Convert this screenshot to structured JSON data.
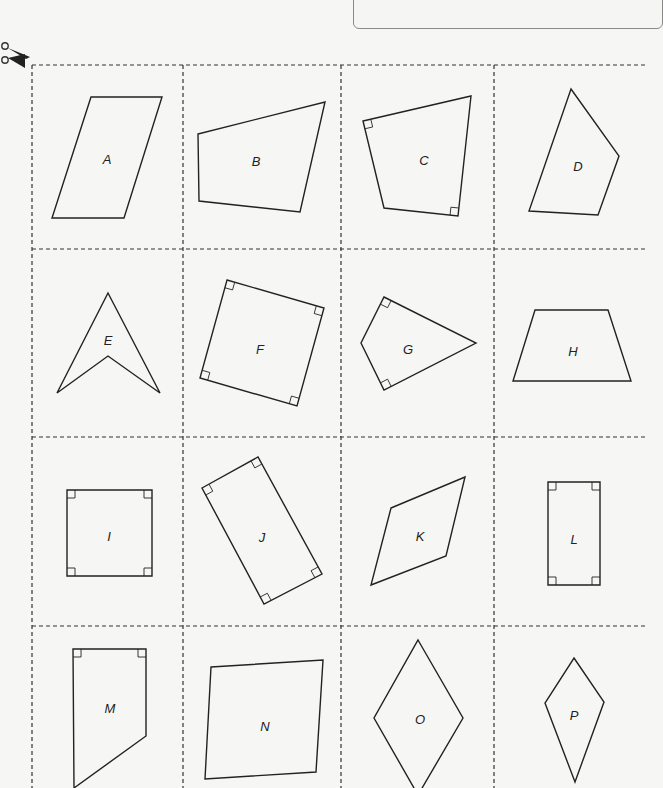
{
  "page": {
    "colors": {
      "background": "#f6f6f4",
      "line": "#222222",
      "cut_line": "#333333"
    }
  },
  "grid": {
    "columns_x": [
      32,
      183,
      341,
      494,
      645
    ],
    "rows_y": [
      65,
      249,
      437,
      626,
      788
    ]
  },
  "cards": [
    {
      "label": "A",
      "label_pos": [
        107,
        160
      ],
      "points": [
        [
          91,
          97
        ],
        [
          162,
          97
        ],
        [
          124,
          218
        ],
        [
          52,
          218
        ]
      ],
      "right_angles": []
    },
    {
      "label": "B",
      "label_pos": [
        256,
        162
      ],
      "points": [
        [
          198,
          134
        ],
        [
          325,
          102
        ],
        [
          300,
          212
        ],
        [
          199,
          201
        ]
      ],
      "right_angles": []
    },
    {
      "label": "C",
      "label_pos": [
        424,
        161
      ],
      "points": [
        [
          363,
          121
        ],
        [
          471,
          96
        ],
        [
          458,
          216
        ],
        [
          384,
          208
        ]
      ],
      "right_angles": [
        [
          363,
          121,
          1
        ],
        [
          458,
          216,
          -1
        ]
      ]
    },
    {
      "label": "D",
      "label_pos": [
        578,
        167
      ],
      "points": [
        [
          571,
          89
        ],
        [
          619,
          156
        ],
        [
          598,
          215
        ],
        [
          529,
          211
        ]
      ],
      "right_angles": []
    },
    {
      "label": "E",
      "label_pos": [
        108,
        341
      ],
      "points": [
        [
          108,
          293
        ],
        [
          160,
          393
        ],
        [
          108,
          356
        ],
        [
          57,
          393
        ]
      ],
      "right_angles": []
    },
    {
      "label": "F",
      "label_pos": [
        260,
        350
      ],
      "points": [
        [
          227,
          280
        ],
        [
          324,
          308
        ],
        [
          297,
          406
        ],
        [
          200,
          378
        ]
      ],
      "right_angles": [
        [
          227,
          280,
          0
        ],
        [
          324,
          308,
          1
        ],
        [
          297,
          406,
          2
        ],
        [
          200,
          378,
          3
        ]
      ]
    },
    {
      "label": "G",
      "label_pos": [
        408,
        350
      ],
      "points": [
        [
          384,
          297
        ],
        [
          476,
          343
        ],
        [
          384,
          390
        ],
        [
          361,
          343
        ]
      ],
      "right_angles": [
        [
          384,
          297,
          0
        ],
        [
          384,
          390,
          3
        ]
      ]
    },
    {
      "label": "H",
      "label_pos": [
        573,
        352
      ],
      "points": [
        [
          535,
          310
        ],
        [
          608,
          310
        ],
        [
          631,
          381
        ],
        [
          513,
          381
        ]
      ],
      "right_angles": []
    },
    {
      "label": "I",
      "label_pos": [
        109,
        537
      ],
      "points": [
        [
          67,
          490
        ],
        [
          152,
          490
        ],
        [
          152,
          576
        ],
        [
          67,
          576
        ]
      ],
      "right_angles": [
        [
          67,
          490,
          0
        ],
        [
          152,
          490,
          1
        ],
        [
          152,
          576,
          2
        ],
        [
          67,
          576,
          3
        ]
      ]
    },
    {
      "label": "J",
      "label_pos": [
        262,
        538
      ],
      "points": [
        [
          202,
          488
        ],
        [
          258,
          457
        ],
        [
          322,
          574
        ],
        [
          264,
          604
        ]
      ],
      "right_angles": [
        [
          202,
          488,
          0
        ],
        [
          258,
          457,
          1
        ],
        [
          322,
          574,
          2
        ],
        [
          264,
          604,
          3
        ]
      ]
    },
    {
      "label": "K",
      "label_pos": [
        420,
        537
      ],
      "points": [
        [
          391,
          508
        ],
        [
          465,
          477
        ],
        [
          446,
          556
        ],
        [
          371,
          585
        ]
      ],
      "right_angles": []
    },
    {
      "label": "L",
      "label_pos": [
        574,
        540
      ],
      "points": [
        [
          548,
          482
        ],
        [
          600,
          482
        ],
        [
          600,
          585
        ],
        [
          548,
          585
        ]
      ],
      "right_angles": [
        [
          548,
          482,
          0
        ],
        [
          600,
          482,
          1
        ],
        [
          600,
          585,
          2
        ],
        [
          548,
          585,
          3
        ]
      ]
    },
    {
      "label": "M",
      "label_pos": [
        110,
        709
      ],
      "points": [
        [
          73,
          649
        ],
        [
          146,
          649
        ],
        [
          146,
          736
        ],
        [
          74,
          788
        ]
      ],
      "right_angles": [
        [
          73,
          649,
          0
        ],
        [
          146,
          649,
          1
        ]
      ]
    },
    {
      "label": "N",
      "label_pos": [
        265,
        727
      ],
      "points": [
        [
          211,
          667
        ],
        [
          323,
          660
        ],
        [
          316,
          772
        ],
        [
          205,
          779
        ]
      ],
      "right_angles": []
    },
    {
      "label": "O",
      "label_pos": [
        420,
        720
      ],
      "points": [
        [
          418,
          640
        ],
        [
          463,
          718
        ],
        [
          418,
          795
        ],
        [
          374,
          718
        ]
      ],
      "right_angles": []
    },
    {
      "label": "P",
      "label_pos": [
        574,
        716
      ],
      "points": [
        [
          574,
          658
        ],
        [
          604,
          702
        ],
        [
          575,
          782
        ],
        [
          545,
          703
        ]
      ],
      "right_angles": []
    }
  ]
}
